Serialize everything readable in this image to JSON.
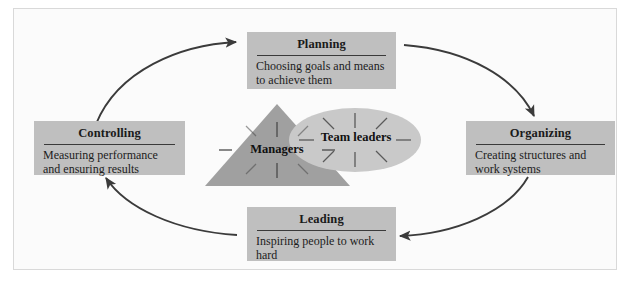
{
  "diagram": {
    "type": "cycle-diagram",
    "colors": {
      "box_fill": "#bfbfbf",
      "triangle_fill": "#a0a0a0",
      "ellipse_fill": "#c9c9c9",
      "arrow": "#3b3b3b",
      "rule": "#3a3a3a",
      "frame_border": "#d9d9d9",
      "page_background": "#fbfbfb",
      "text": "#1a1a1a"
    },
    "functions": [
      {
        "id": "planning",
        "title": "Planning",
        "description": "Choosing goals and means to achieve them",
        "position": "top"
      },
      {
        "id": "organizing",
        "title": "Organizing",
        "description": "Creating structures and work systems",
        "position": "right"
      },
      {
        "id": "leading",
        "title": "Leading",
        "description": "Inspiring people to work hard",
        "position": "bottom"
      },
      {
        "id": "controlling",
        "title": "Controlling",
        "description": "Measuring performance and ensuring results",
        "position": "left"
      }
    ],
    "core": {
      "triangle_label": "Managers",
      "ellipse_label": "Team leaders",
      "starburst_rays": 8
    },
    "arrows": [
      {
        "from": "controlling",
        "to": "planning"
      },
      {
        "from": "planning",
        "to": "organizing"
      },
      {
        "from": "organizing",
        "to": "leading"
      },
      {
        "from": "leading",
        "to": "controlling"
      }
    ]
  }
}
